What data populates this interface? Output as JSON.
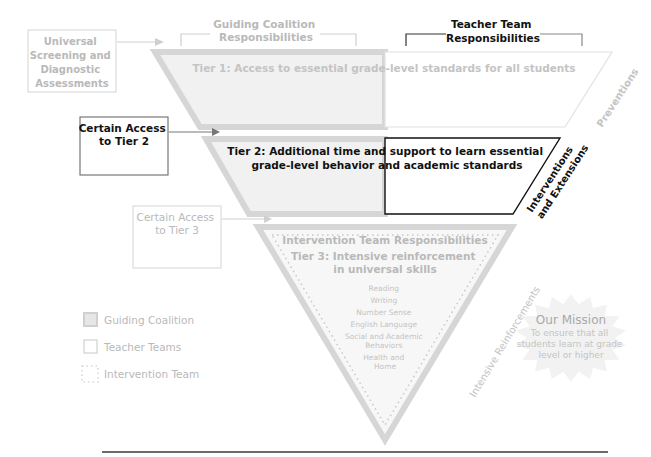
{
  "colors": {
    "gray_border": "#d3d3d3",
    "gray_fill": "#f3f3f3",
    "gray_text": "#b9b9b9",
    "black": "#111111",
    "dark_line": "#4a4a4a"
  },
  "headers": {
    "guiding": [
      "Guiding Coalition",
      "Responsibilities"
    ],
    "teacher": [
      "Teacher Team",
      "Responsibilities"
    ]
  },
  "side_boxes": {
    "universal": [
      "Universal",
      "Screening and",
      "Diagnostic",
      "Assessments"
    ],
    "tier2_access": [
      "Certain Access",
      "to Tier 2"
    ],
    "tier3_access": [
      "Certain Access",
      "to Tier 3"
    ]
  },
  "tiers": {
    "tier1": "Tier 1: Access to essential grade-level standards for all students",
    "tier2": [
      "Tier 2: Additional time and support to learn essential",
      "grade-level behavior and academic standards"
    ],
    "tier3_header": "Intervention Team Responsibilities",
    "tier3_title": [
      "Tier 3: Intensive reinforcement",
      "in universal skills"
    ],
    "tier3_skills": [
      "Reading",
      "Writing",
      "Number Sense",
      "English Language",
      "Social and Academic",
      "Behaviors",
      "Health and",
      "Home"
    ]
  },
  "side_labels": {
    "preventions": "Preventions",
    "interventions": [
      "Interventions",
      "and Extensions"
    ],
    "reinforcements": "Intensive Reinforcements"
  },
  "legend": [
    {
      "icon": "gray-filled-square",
      "label": "Guiding Coalition"
    },
    {
      "icon": "outline-square",
      "label": "Teacher Teams"
    },
    {
      "icon": "dotted-square",
      "label": "Intervention Team"
    }
  ],
  "mission": {
    "title": "Our Mission",
    "lines": [
      "To ensure that all",
      "students learn at grade",
      "level or higher"
    ]
  }
}
